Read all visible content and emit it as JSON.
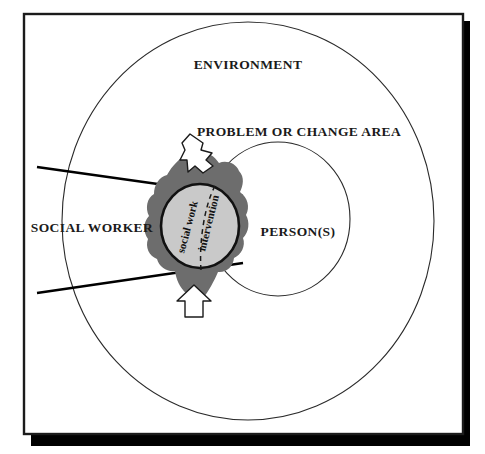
{
  "figure": {
    "kind": "concentric-systems-diagram",
    "title_text": null,
    "frame": {
      "border_color": "#1b1b1b",
      "shadow_color": "#000000",
      "background": "#ffffff"
    }
  },
  "labels": {
    "environment": "ENVIRONMENT",
    "problem_or_change_area": "PROBLEM OR CHANGE AREA",
    "social_worker": "SOCIAL WORKER",
    "persons": "PERSON(S)",
    "intervention_left": "social work",
    "intervention_right": "intervention"
  },
  "colors": {
    "outline": "#1b1b1b",
    "blob_fill": "#6d6d6d",
    "circle_fill": "#c9c9c9",
    "wedge_stroke": "#000000",
    "arrow_fill": "#ffffff",
    "arrow_stroke": "#1b1b1b",
    "dashed_divider": "#1b1b1b"
  },
  "shapes": [
    {
      "name": "environment-circle",
      "type": "ellipse",
      "cx": 248,
      "cy": 221,
      "rx": 186,
      "ry": 199
    },
    {
      "name": "person-circle",
      "type": "ellipse",
      "cx": 278,
      "cy": 219,
      "rx": 72,
      "ry": 77
    },
    {
      "name": "intervention-blob",
      "type": "irregular-polygon"
    },
    {
      "name": "intervention-circle",
      "type": "ellipse",
      "cx": 200,
      "cy": 226,
      "rx": 39,
      "ry": 42
    },
    {
      "name": "social-worker-wedge",
      "type": "two-lines"
    },
    {
      "name": "arrow-top",
      "type": "block-arrow",
      "direction": "up"
    },
    {
      "name": "arrow-bottom",
      "type": "block-arrow",
      "direction": "up"
    }
  ]
}
